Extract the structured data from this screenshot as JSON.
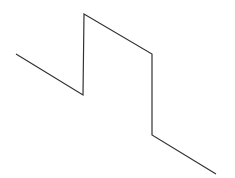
{
  "diagram": {
    "type": "polyline",
    "stroke": "#333333",
    "stroke_width": 1.2,
    "points": [
      [
        16,
        54
      ],
      [
        83,
        95
      ],
      [
        84,
        14
      ],
      [
        152,
        54
      ],
      [
        152,
        135
      ],
      [
        216,
        174
      ]
    ]
  }
}
